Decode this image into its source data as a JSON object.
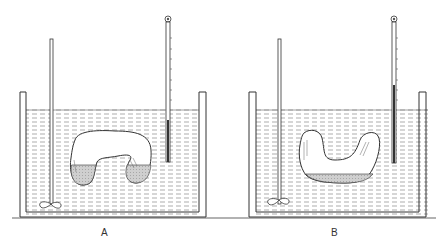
{
  "figure": {
    "panels": [
      {
        "id": "A",
        "label": "A",
        "description": "Tube in water bath, liquid in both lower arms (U-shape inverted, ends down)"
      },
      {
        "id": "B",
        "label": "B",
        "description": "Tube rotated, liquid collected at bottom of U-shaped tube"
      }
    ],
    "components": [
      "water-bath-tank",
      "stirrer",
      "thermometer",
      "bent-glass-tube",
      "liquid"
    ],
    "colors": {
      "line": "#333333",
      "water_dash": "#8a8a8a",
      "liquid_fill": "#c8c8c8",
      "background": "#ffffff"
    }
  }
}
